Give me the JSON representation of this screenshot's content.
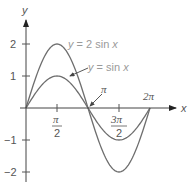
{
  "chart_data": {
    "type": "line",
    "title": "",
    "xlabel": "x",
    "ylabel": "y",
    "xlim": [
      0,
      6.2832
    ],
    "ylim": [
      -2,
      2
    ],
    "grid": false,
    "x_ticks": [
      "π/2",
      "3π/2"
    ],
    "x_annotated_points": [
      "π",
      "2π"
    ],
    "y_ticks": [
      "2",
      "1",
      "−1",
      "−2"
    ],
    "series": [
      {
        "name": "y = 2 sin x",
        "x": [
          0,
          0.7854,
          1.5708,
          2.3562,
          3.1416,
          3.927,
          4.7124,
          5.4978,
          6.2832
        ],
        "values": [
          0,
          1.414,
          2,
          1.414,
          0,
          -1.414,
          -2,
          -1.414,
          0
        ]
      },
      {
        "name": "y = sin x",
        "x": [
          0,
          0.7854,
          1.5708,
          2.3562,
          3.1416,
          3.927,
          4.7124,
          5.4978,
          6.2832
        ],
        "values": [
          0,
          0.707,
          1,
          0.707,
          0,
          -0.707,
          -1,
          -0.707,
          0
        ]
      }
    ],
    "annotations": [
      {
        "text": "y = 2 sin x",
        "points_to": "upper curve"
      },
      {
        "text": "y = sin x",
        "points_to": "lower curve (arrow)"
      },
      {
        "text": "π",
        "points_to": "zero crossing at x = π (arrow)"
      },
      {
        "text": "2π",
        "points_to": "zero crossing at x = 2π"
      }
    ],
    "legend": "none (inline curve labels)"
  },
  "axes": {
    "x_label": "x",
    "y_label": "y"
  },
  "ticks": {
    "y": [
      {
        "label": "2",
        "value": 2
      },
      {
        "label": "1",
        "value": 1
      },
      {
        "label": "−1",
        "value": -1
      },
      {
        "label": "−2",
        "value": -2
      }
    ],
    "x_half_pi_num": "π",
    "x_half_pi_den": "2",
    "x_three_half_pi_num": "3π",
    "x_three_half_pi_den": "2",
    "pi": "π",
    "two_pi": "2π"
  },
  "labels": {
    "curve_2sin_prefix": "y",
    "curve_2sin_rest": " = 2 sin ",
    "curve_2sin_var": "x",
    "curve_sin_prefix": "y",
    "curve_sin_rest": " = sin ",
    "curve_sin_var": "x"
  },
  "colors": {
    "axis": "#333333",
    "curve": "#6e6e6e",
    "label": "#9a9a9a"
  }
}
